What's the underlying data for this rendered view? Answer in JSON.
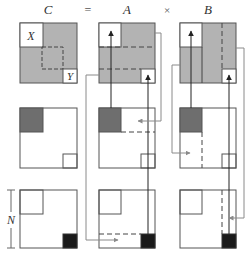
{
  "header": {
    "c_label": "C",
    "eq_label": "=",
    "a_label": "A",
    "times_label": "×",
    "b_label": "B"
  },
  "labels": {
    "x": "X",
    "y": "Y",
    "n": "N"
  },
  "colors": {
    "light_gray": "#b3b3b3",
    "dark_gray": "#6e6e6e",
    "black": "#1a1a1a",
    "stroke": "#555555",
    "arrow_line": "#8a8a8a"
  },
  "layout": {
    "columns": [
      "C",
      "A",
      "B"
    ],
    "rows": 3
  }
}
